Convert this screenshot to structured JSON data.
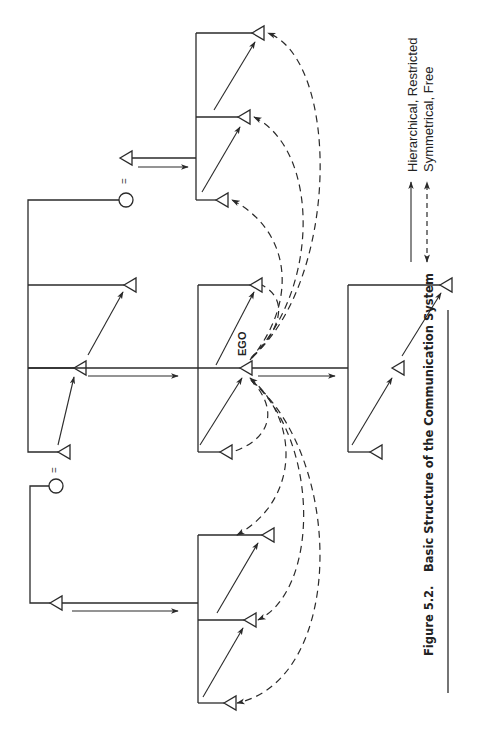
{
  "figure": {
    "number": "Figure 5.2.",
    "title": "Basic Structure of the Communication System"
  },
  "labels": {
    "ego": "EGO",
    "marriage_symbol": "="
  },
  "legend": {
    "items": [
      {
        "style": "solid",
        "arrow": "single-headed",
        "label": "Hierarchical, Restricted"
      },
      {
        "style": "dashed",
        "arrow": "double-headed",
        "label": "Symmetrical, Free"
      }
    ]
  },
  "colors": {
    "line": "#2a2a2a",
    "background": "#ffffff"
  }
}
